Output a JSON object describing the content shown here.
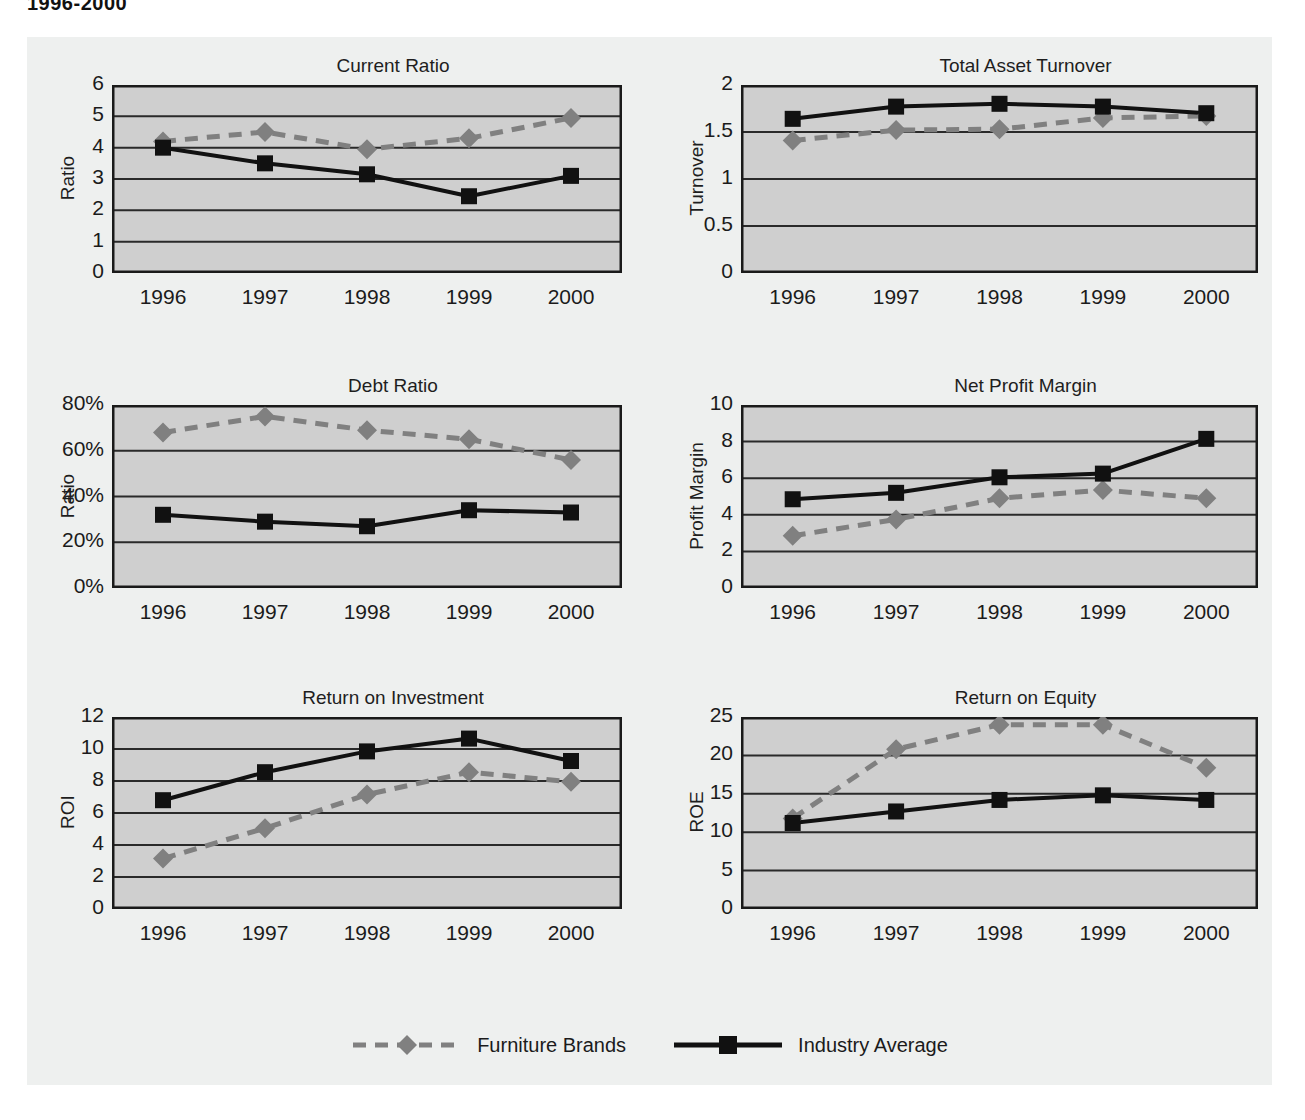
{
  "page": {
    "title": "1996-2000",
    "background": "#ffffff",
    "panel_background": "#eef0ef"
  },
  "series_styles": {
    "furniture_brands": {
      "name": "Furniture Brands",
      "color": "#808080",
      "marker": "diamond",
      "dash": "dashed",
      "line_width": 5
    },
    "industry_average": {
      "name": "Industry Average",
      "color": "#111111",
      "marker": "square",
      "dash": "solid",
      "line_width": 4
    }
  },
  "legend": {
    "position": "bottom-center",
    "entries": [
      {
        "label": "Furniture Brands",
        "color": "#808080",
        "marker": "diamond",
        "dash": "dashed"
      },
      {
        "label": "Industry Average",
        "color": "#111111",
        "marker": "square",
        "dash": "solid"
      }
    ]
  },
  "plot_style": {
    "plot_fill": "#cfcfcf",
    "grid_color": "#2a2a2a",
    "axis_color": "#1a1a1a",
    "grid": "horizontal"
  },
  "chart_data": [
    {
      "id": "current-ratio",
      "type": "line",
      "title": "Current Ratio",
      "xlabel": "",
      "ylabel": "Ratio",
      "categories": [
        "1996",
        "1997",
        "1998",
        "1999",
        "2000"
      ],
      "ylim": [
        0,
        6
      ],
      "yticks": [
        0,
        1,
        2,
        3,
        4,
        5,
        6
      ],
      "ytick_labels": [
        "0",
        "1",
        "2",
        "3",
        "4",
        "5",
        "6"
      ],
      "series": [
        {
          "name": "Furniture Brands",
          "values": [
            4.2,
            4.5,
            3.95,
            4.3,
            4.95
          ]
        },
        {
          "name": "Industry Average",
          "values": [
            4.0,
            3.5,
            3.15,
            2.45,
            3.1
          ]
        }
      ]
    },
    {
      "id": "total-asset-turnover",
      "type": "line",
      "title": "Total Asset Turnover",
      "xlabel": "",
      "ylabel": "Turnover",
      "categories": [
        "1996",
        "1997",
        "1998",
        "1999",
        "2000"
      ],
      "ylim": [
        0,
        2
      ],
      "yticks": [
        0,
        0.5,
        1,
        1.5,
        2
      ],
      "ytick_labels": [
        "0",
        "0.5",
        "1",
        "1.5",
        "2"
      ],
      "series": [
        {
          "name": "Furniture Brands",
          "values": [
            1.41,
            1.52,
            1.53,
            1.65,
            1.67
          ]
        },
        {
          "name": "Industry Average",
          "values": [
            1.64,
            1.77,
            1.8,
            1.77,
            1.7
          ]
        }
      ]
    },
    {
      "id": "debt-ratio",
      "type": "line",
      "title": "Debt Ratio",
      "xlabel": "",
      "ylabel": "Ratio",
      "categories": [
        "1996",
        "1997",
        "1998",
        "1999",
        "2000"
      ],
      "ylim": [
        0,
        80
      ],
      "yticks": [
        0,
        20,
        40,
        60,
        80
      ],
      "ytick_labels": [
        "0%",
        "20%",
        "40%",
        "60%",
        "80%"
      ],
      "series": [
        {
          "name": "Furniture Brands",
          "values": [
            68,
            75,
            69,
            65,
            56
          ]
        },
        {
          "name": "Industry Average",
          "values": [
            32,
            29,
            27,
            34,
            33
          ]
        }
      ]
    },
    {
      "id": "net-profit-margin",
      "type": "line",
      "title": "Net Profit Margin",
      "xlabel": "",
      "ylabel": "Profit Margin",
      "categories": [
        "1996",
        "1997",
        "1998",
        "1999",
        "2000"
      ],
      "ylim": [
        0,
        10
      ],
      "yticks": [
        0,
        2,
        4,
        6,
        8,
        10
      ],
      "ytick_labels": [
        "0",
        "2",
        "4",
        "6",
        "8",
        "10"
      ],
      "series": [
        {
          "name": "Furniture Brands",
          "values": [
            2.85,
            3.75,
            4.9,
            5.35,
            4.9
          ]
        },
        {
          "name": "Industry Average",
          "values": [
            4.85,
            5.2,
            6.05,
            6.25,
            8.15
          ]
        }
      ]
    },
    {
      "id": "return-on-investment",
      "type": "line",
      "title": "Return on Investment",
      "xlabel": "",
      "ylabel": "ROI",
      "categories": [
        "1996",
        "1997",
        "1998",
        "1999",
        "2000"
      ],
      "ylim": [
        0,
        12
      ],
      "yticks": [
        0,
        2,
        4,
        6,
        8,
        10,
        12
      ],
      "ytick_labels": [
        "0",
        "2",
        "4",
        "6",
        "8",
        "10",
        "12"
      ],
      "series": [
        {
          "name": "Furniture Brands",
          "values": [
            3.15,
            5.05,
            7.15,
            8.55,
            7.95
          ]
        },
        {
          "name": "Industry Average",
          "values": [
            6.8,
            8.55,
            9.85,
            10.65,
            9.25
          ]
        }
      ]
    },
    {
      "id": "return-on-equity",
      "type": "line",
      "title": "Return on Equity",
      "xlabel": "",
      "ylabel": "ROE",
      "categories": [
        "1996",
        "1997",
        "1998",
        "1999",
        "2000"
      ],
      "ylim": [
        0,
        25
      ],
      "yticks": [
        0,
        5,
        10,
        15,
        20,
        25
      ],
      "ytick_labels": [
        "0",
        "5",
        "10",
        "15",
        "20",
        "25"
      ],
      "series": [
        {
          "name": "Furniture Brands",
          "values": [
            11.8,
            20.8,
            24.0,
            24.0,
            18.4
          ]
        },
        {
          "name": "Industry Average",
          "values": [
            11.2,
            12.7,
            14.2,
            14.8,
            14.2
          ]
        }
      ]
    }
  ]
}
